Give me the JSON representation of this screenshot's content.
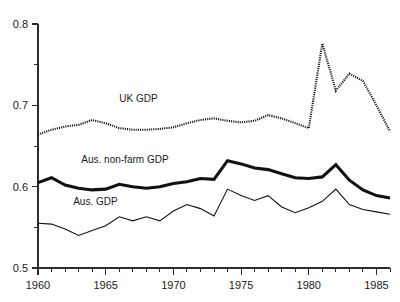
{
  "chart_data": {
    "type": "line",
    "title": "",
    "subtitle": "",
    "xlabel": "",
    "ylabel": "",
    "xlim": [
      1960,
      1986
    ],
    "ylim": [
      0.5,
      0.8
    ],
    "grid": false,
    "legend_position": "inline-annotations",
    "x_ticks_major": [
      "1960",
      "1965",
      "1970",
      "1975",
      "1980",
      "1985"
    ],
    "x_tick_values_major": [
      1960,
      1965,
      1970,
      1975,
      1980,
      1985
    ],
    "x_tick_values_minor": [
      1961,
      1962,
      1963,
      1964,
      1966,
      1967,
      1968,
      1969,
      1971,
      1972,
      1973,
      1974,
      1976,
      1977,
      1978,
      1979,
      1981,
      1982,
      1983,
      1984,
      1986
    ],
    "y_ticks_major": [
      "0.5",
      "0.6",
      "0.7",
      "0.8"
    ],
    "y_tick_values_major": [
      0.5,
      0.6,
      0.7,
      0.8
    ],
    "y_tick_values_minor": [
      0.55,
      0.65,
      0.75
    ],
    "x": [
      1960,
      1961,
      1962,
      1963,
      1964,
      1965,
      1966,
      1967,
      1968,
      1969,
      1970,
      1971,
      1972,
      1973,
      1974,
      1975,
      1976,
      1977,
      1978,
      1979,
      1980,
      1981,
      1982,
      1983,
      1984,
      1985,
      1986
    ],
    "series": [
      {
        "name": "UK GDP",
        "style": "dotted",
        "label_x": 1966.0,
        "label_y": 0.704,
        "values": [
          0.664,
          0.67,
          0.674,
          0.676,
          0.682,
          0.678,
          0.672,
          0.67,
          0.67,
          0.671,
          0.673,
          0.678,
          0.682,
          0.684,
          0.681,
          0.679,
          0.681,
          0.688,
          0.684,
          0.678,
          0.672,
          0.776,
          0.718,
          0.739,
          0.73,
          0.7,
          0.668
        ]
      },
      {
        "name": "Aus. non-farm GDP",
        "style": "thick",
        "label_x": 1963.2,
        "label_y": 0.629,
        "values": [
          0.605,
          0.611,
          0.602,
          0.598,
          0.596,
          0.597,
          0.603,
          0.6,
          0.598,
          0.6,
          0.604,
          0.606,
          0.61,
          0.609,
          0.632,
          0.628,
          0.623,
          0.621,
          0.616,
          0.611,
          0.61,
          0.612,
          0.627,
          0.608,
          0.596,
          0.589,
          0.586
        ]
      },
      {
        "name": "Aus. GDP",
        "style": "thin",
        "label_x": 1962.6,
        "label_y": 0.578,
        "values": [
          0.555,
          0.554,
          0.548,
          0.54,
          0.546,
          0.552,
          0.563,
          0.558,
          0.563,
          0.558,
          0.57,
          0.578,
          0.573,
          0.564,
          0.597,
          0.589,
          0.583,
          0.589,
          0.575,
          0.568,
          0.574,
          0.582,
          0.597,
          0.578,
          0.572,
          0.569,
          0.566
        ]
      }
    ]
  },
  "axes": {
    "y_axis_name": "y-axis",
    "x_axis_name": "x-axis"
  }
}
